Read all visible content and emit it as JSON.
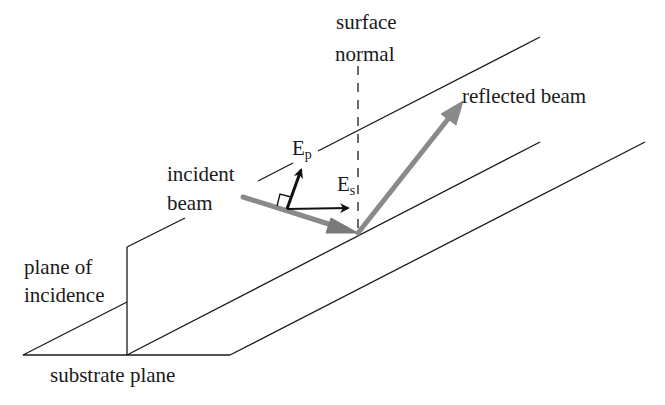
{
  "diagram": {
    "type": "optics-reflection-geometry",
    "labels": {
      "surface_normal_line1": "surface",
      "surface_normal_line2": "normal",
      "reflected_beam": "reflected beam",
      "incident_beam_line1": "incident",
      "incident_beam_line2": "beam",
      "ep_main": "E",
      "ep_sub": "p",
      "es_main": "E",
      "es_sub": "s",
      "plane_of_incidence_line1": "plane of",
      "plane_of_incidence_line2": "incidence",
      "substrate_plane": "substrate plane"
    },
    "colors": {
      "line": "#1a1a1a",
      "beam": "#8a8a8a",
      "vector": "#111111",
      "background": "#ffffff"
    },
    "elements": [
      "substrate plane (parallelogram)",
      "plane of incidence (vertical parallelogram)",
      "surface normal (dashed vertical line)",
      "incident beam (gray arrow)",
      "reflected beam (gray arrow)",
      "E_p vector (perpendicular to incident beam, right-angle marker)",
      "E_s vector (parallel to surface)"
    ]
  }
}
